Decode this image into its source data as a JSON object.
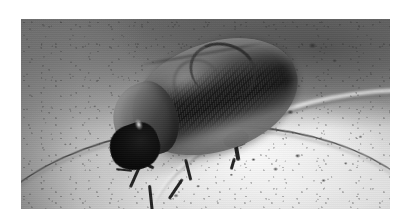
{
  "document": {
    "type": "photograph",
    "background_color": "#ffffff",
    "caption": ""
  },
  "photo": {
    "title": "Beetle on pale concrete surface",
    "color_mode": "grayscale",
    "frame": {
      "left_px": 21,
      "top_px": 19,
      "width_px": 369,
      "height_px": 190
    },
    "subject": {
      "name": "beetle",
      "description": "Dark oval beetle viewed from above, tilted with head toward lower-left, resting on a pale gritty surface",
      "parts": [
        {
          "name": "elytra",
          "label": "Elytra (wing cases)"
        },
        {
          "name": "pronotum",
          "label": "Pronotum"
        },
        {
          "name": "head",
          "label": "Head and mouthparts"
        },
        {
          "name": "foreleg",
          "label": "Foreleg"
        },
        {
          "name": "mid-leg",
          "label": "Mid leg"
        },
        {
          "name": "hind-leg",
          "label": "Hind leg"
        },
        {
          "name": "antenna",
          "label": "Antenna arching over body"
        }
      ]
    },
    "background_elements": [
      {
        "name": "dish-rim-dark-arc",
        "label": "Dark curved rim line crossing lower left"
      },
      {
        "name": "dish-rim-bright-ridge",
        "label": "Bright curved ridge in upper right"
      },
      {
        "name": "grit-speckles",
        "label": "Dark grit and debris specks"
      },
      {
        "name": "highlight-pool",
        "label": "Bright lit area lower centre-right"
      },
      {
        "name": "dark-upper-field",
        "label": "Darker grey zone across the top"
      }
    ],
    "palette": {
      "paper_white": "#ffffff",
      "surface_light": "#e8e8e6",
      "surface_mid": "#c9c9c9",
      "surface_dark": "#8f8f8f",
      "upper_shadow": "#606060",
      "beetle_mid": "#76726e",
      "beetle_dark": "#201f1e",
      "beetle_black": "#0e0d0d",
      "highlight": "#f8f8f5"
    }
  }
}
